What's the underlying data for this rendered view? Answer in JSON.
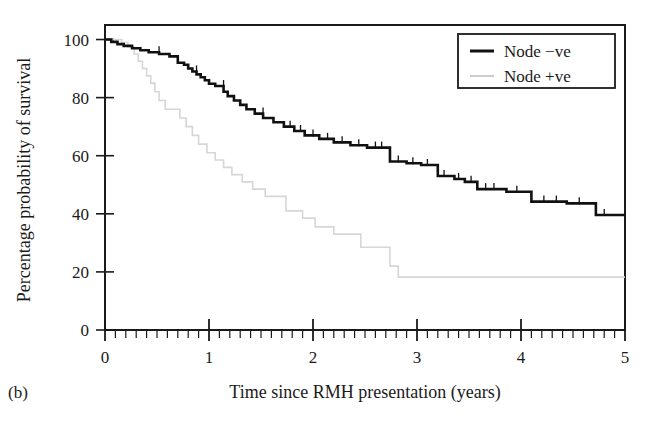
{
  "figure": {
    "panel_label": "(b)",
    "background_color": "#ffffff"
  },
  "chart_data": {
    "type": "line",
    "subtype": "kaplan-meier-step",
    "title": "",
    "xlabel": "Time since RMH presentation (years)",
    "ylabel": "Percentage probability of survival",
    "xlim": [
      0,
      5
    ],
    "ylim": [
      0,
      105
    ],
    "xticks": [
      0,
      1,
      2,
      3,
      4,
      5
    ],
    "xtick_labels": [
      "0",
      "1",
      "2",
      "3",
      "4",
      "5"
    ],
    "yticks": [
      0,
      20,
      40,
      60,
      80,
      100
    ],
    "ytick_labels": [
      "0",
      "20",
      "40",
      "60",
      "80",
      "100"
    ],
    "x_minor_tick_interval": 0.1,
    "grid": false,
    "frame": true,
    "legend_position": "top-right",
    "series": [
      {
        "name": "Node −ve",
        "color": "#111111",
        "line_width": 2.6,
        "points": [
          [
            0.0,
            100.0
          ],
          [
            0.06,
            100.0
          ],
          [
            0.06,
            99.2
          ],
          [
            0.12,
            99.2
          ],
          [
            0.12,
            98.4
          ],
          [
            0.18,
            98.4
          ],
          [
            0.18,
            97.8
          ],
          [
            0.26,
            97.8
          ],
          [
            0.26,
            97.0
          ],
          [
            0.34,
            97.0
          ],
          [
            0.34,
            96.3
          ],
          [
            0.42,
            96.3
          ],
          [
            0.42,
            95.6
          ],
          [
            0.52,
            95.6
          ],
          [
            0.52,
            95.0
          ],
          [
            0.62,
            95.0
          ],
          [
            0.62,
            94.2
          ],
          [
            0.7,
            94.2
          ],
          [
            0.7,
            92.0
          ],
          [
            0.76,
            92.0
          ],
          [
            0.76,
            91.3
          ],
          [
            0.8,
            91.3
          ],
          [
            0.8,
            90.0
          ],
          [
            0.84,
            90.0
          ],
          [
            0.84,
            89.0
          ],
          [
            0.88,
            89.0
          ],
          [
            0.88,
            88.0
          ],
          [
            0.92,
            88.0
          ],
          [
            0.92,
            87.0
          ],
          [
            0.96,
            87.0
          ],
          [
            0.96,
            86.0
          ],
          [
            1.0,
            86.0
          ],
          [
            1.0,
            84.8
          ],
          [
            1.06,
            84.8
          ],
          [
            1.06,
            84.0
          ],
          [
            1.14,
            84.0
          ],
          [
            1.14,
            82.0
          ],
          [
            1.18,
            82.0
          ],
          [
            1.18,
            80.5
          ],
          [
            1.24,
            80.5
          ],
          [
            1.24,
            79.0
          ],
          [
            1.3,
            79.0
          ],
          [
            1.3,
            77.5
          ],
          [
            1.36,
            77.5
          ],
          [
            1.36,
            76.0
          ],
          [
            1.44,
            76.0
          ],
          [
            1.44,
            74.5
          ],
          [
            1.52,
            74.5
          ],
          [
            1.52,
            73.0
          ],
          [
            1.62,
            73.0
          ],
          [
            1.62,
            71.5
          ],
          [
            1.72,
            71.5
          ],
          [
            1.72,
            70.0
          ],
          [
            1.82,
            70.0
          ],
          [
            1.82,
            68.5
          ],
          [
            1.92,
            68.5
          ],
          [
            1.92,
            67.0
          ],
          [
            2.06,
            67.0
          ],
          [
            2.06,
            65.8
          ],
          [
            2.2,
            65.8
          ],
          [
            2.2,
            64.6
          ],
          [
            2.36,
            64.6
          ],
          [
            2.36,
            63.6
          ],
          [
            2.52,
            63.6
          ],
          [
            2.52,
            62.8
          ],
          [
            2.74,
            62.8
          ],
          [
            2.74,
            58.0
          ],
          [
            2.9,
            58.0
          ],
          [
            2.9,
            57.4
          ],
          [
            3.04,
            57.4
          ],
          [
            3.04,
            56.8
          ],
          [
            3.2,
            56.8
          ],
          [
            3.2,
            53.0
          ],
          [
            3.36,
            53.0
          ],
          [
            3.36,
            52.0
          ],
          [
            3.46,
            52.0
          ],
          [
            3.46,
            51.0
          ],
          [
            3.58,
            51.0
          ],
          [
            3.58,
            48.5
          ],
          [
            3.86,
            48.5
          ],
          [
            3.86,
            47.6
          ],
          [
            4.1,
            47.6
          ],
          [
            4.1,
            44.2
          ],
          [
            4.44,
            44.2
          ],
          [
            4.44,
            43.6
          ],
          [
            4.72,
            43.6
          ],
          [
            4.72,
            39.6
          ],
          [
            5.0,
            39.6
          ]
        ],
        "censor_marks": [
          [
            0.52,
            95.6
          ],
          [
            0.88,
            89.0
          ],
          [
            1.14,
            84.0
          ],
          [
            1.52,
            74.5
          ],
          [
            1.78,
            70.0
          ],
          [
            1.88,
            68.5
          ],
          [
            2.0,
            67.0
          ],
          [
            2.14,
            65.8
          ],
          [
            2.28,
            64.6
          ],
          [
            2.44,
            63.6
          ],
          [
            2.6,
            62.8
          ],
          [
            2.66,
            62.8
          ],
          [
            2.82,
            58.0
          ],
          [
            2.96,
            57.4
          ],
          [
            3.1,
            56.8
          ],
          [
            3.26,
            53.0
          ],
          [
            3.4,
            52.0
          ],
          [
            3.52,
            51.0
          ],
          [
            3.66,
            48.5
          ],
          [
            3.74,
            48.5
          ],
          [
            3.96,
            47.6
          ],
          [
            4.22,
            44.2
          ],
          [
            4.34,
            44.2
          ],
          [
            4.56,
            43.6
          ],
          [
            4.8,
            39.6
          ]
        ],
        "start_value": 100.0,
        "end_value": 39.6
      },
      {
        "name": "Node +ve",
        "color": "#d6d6d6",
        "line_width": 1.6,
        "points": [
          [
            0.0,
            100.0
          ],
          [
            0.16,
            100.0
          ],
          [
            0.16,
            99.0
          ],
          [
            0.22,
            99.0
          ],
          [
            0.22,
            97.5
          ],
          [
            0.28,
            97.5
          ],
          [
            0.28,
            95.0
          ],
          [
            0.32,
            95.0
          ],
          [
            0.32,
            92.5
          ],
          [
            0.36,
            92.5
          ],
          [
            0.36,
            90.0
          ],
          [
            0.4,
            90.0
          ],
          [
            0.4,
            87.5
          ],
          [
            0.44,
            87.5
          ],
          [
            0.44,
            85.0
          ],
          [
            0.48,
            85.0
          ],
          [
            0.48,
            82.0
          ],
          [
            0.52,
            82.0
          ],
          [
            0.52,
            79.0
          ],
          [
            0.58,
            79.0
          ],
          [
            0.58,
            76.0
          ],
          [
            0.72,
            76.0
          ],
          [
            0.72,
            73.0
          ],
          [
            0.78,
            73.0
          ],
          [
            0.78,
            70.0
          ],
          [
            0.84,
            70.0
          ],
          [
            0.84,
            67.0
          ],
          [
            0.9,
            67.0
          ],
          [
            0.9,
            64.0
          ],
          [
            0.98,
            64.0
          ],
          [
            0.98,
            61.0
          ],
          [
            1.06,
            61.0
          ],
          [
            1.06,
            58.5
          ],
          [
            1.14,
            58.5
          ],
          [
            1.14,
            56.0
          ],
          [
            1.22,
            56.0
          ],
          [
            1.22,
            53.5
          ],
          [
            1.32,
            53.5
          ],
          [
            1.32,
            51.0
          ],
          [
            1.42,
            51.0
          ],
          [
            1.42,
            48.5
          ],
          [
            1.54,
            48.5
          ],
          [
            1.54,
            46.0
          ],
          [
            1.74,
            46.0
          ],
          [
            1.74,
            41.0
          ],
          [
            1.9,
            41.0
          ],
          [
            1.9,
            38.5
          ],
          [
            2.02,
            38.5
          ],
          [
            2.02,
            35.5
          ],
          [
            2.2,
            35.5
          ],
          [
            2.2,
            33.0
          ],
          [
            2.46,
            33.0
          ],
          [
            2.46,
            28.5
          ],
          [
            2.74,
            28.5
          ],
          [
            2.74,
            22.0
          ],
          [
            2.82,
            22.0
          ],
          [
            2.82,
            18.2
          ],
          [
            5.0,
            18.2
          ]
        ],
        "censor_marks": [],
        "start_value": 100.0,
        "end_value": 18.2
      }
    ]
  },
  "legend": {
    "items": [
      {
        "label": "Node −ve",
        "color": "#111111",
        "line_width": 3.0
      },
      {
        "label": "Node +ve",
        "color": "#c8c8c8",
        "line_width": 1.8
      }
    ],
    "border_color": "#1a1a1a"
  }
}
